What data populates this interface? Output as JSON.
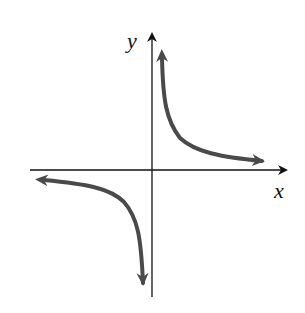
{
  "figure": {
    "type": "function-graph",
    "axes": {
      "x_label": "x",
      "y_label": "y",
      "axis_color": "#111111"
    },
    "curve": {
      "color": "#4a4a4a",
      "branches": [
        "quadrant-I",
        "quadrant-III"
      ],
      "asymptotes": [
        "x-axis",
        "y-axis"
      ]
    }
  }
}
